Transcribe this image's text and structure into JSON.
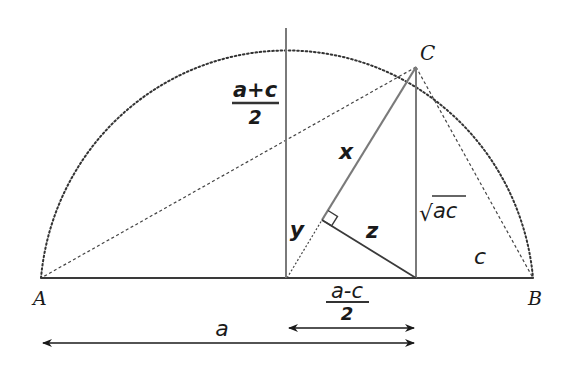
{
  "diagram": {
    "type": "geometry",
    "points": {
      "A": {
        "label": "A",
        "x": 41,
        "y": 278
      },
      "B": {
        "label": "B",
        "x": 533,
        "y": 278
      },
      "C": {
        "label": "C",
        "x": 416,
        "y": 67
      },
      "O": {
        "x": 287,
        "y": 278
      },
      "D": {
        "x": 416,
        "y": 278
      },
      "F": {
        "x": 322,
        "y": 220
      }
    },
    "arc": {
      "cx": 287,
      "cy": 278,
      "r": 247
    },
    "labels": {
      "point_A": "A",
      "point_B": "B",
      "point_C": "C",
      "am_numerator": "a+c",
      "am_denominator": "2",
      "diff_numerator": "a-c",
      "diff_denominator": "2",
      "seg_x": "x",
      "seg_y": "y",
      "seg_z": "z",
      "gm_radical": "√",
      "gm_radicand": "ac",
      "seg_c": "c",
      "seg_a": "a"
    },
    "colors": {
      "baseline": "#3a3a3a",
      "gray_line": "#7a7a7a",
      "dotted": "#333333",
      "text": "#1a1a1a"
    }
  }
}
